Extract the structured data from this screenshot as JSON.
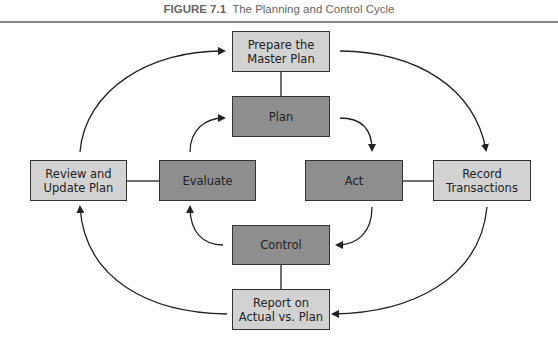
{
  "figure": {
    "label": "FIGURE 7.1",
    "title": "The Planning and Control Cycle"
  },
  "colors": {
    "outer_box_fill": "#d2d2d2",
    "inner_box_fill": "#8e8e8e",
    "stroke": "#222222",
    "title_text": "#666666"
  },
  "outer_cycle": [
    {
      "id": "prepare",
      "label": "Prepare the\nMaster Plan"
    },
    {
      "id": "record",
      "label": "Record\nTransactions"
    },
    {
      "id": "report",
      "label": "Report on\nActual vs. Plan"
    },
    {
      "id": "review",
      "label": "Review and\nUpdate Plan"
    }
  ],
  "inner_cycle": [
    {
      "id": "plan",
      "label": "Plan"
    },
    {
      "id": "act",
      "label": "Act"
    },
    {
      "id": "control",
      "label": "Control"
    },
    {
      "id": "evaluate",
      "label": "Evaluate"
    }
  ],
  "connections": [
    {
      "from": "prepare",
      "to": "plan",
      "type": "line"
    },
    {
      "from": "act",
      "to": "record",
      "type": "line"
    },
    {
      "from": "control",
      "to": "report",
      "type": "line"
    },
    {
      "from": "evaluate",
      "to": "review",
      "type": "line"
    }
  ]
}
